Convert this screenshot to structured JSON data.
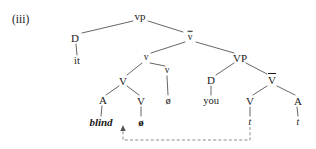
{
  "figure": {
    "example_number": "(iii)",
    "type": "syntax-tree"
  },
  "nodes": {
    "vp": {
      "label": "vp",
      "style": "cat",
      "x": 140,
      "y": 16
    },
    "d_left": {
      "label": "D",
      "style": "cat",
      "x": 75,
      "y": 38
    },
    "it": {
      "label": "it",
      "style": "word",
      "x": 77,
      "y": 61
    },
    "v_bar_low": {
      "label": "v",
      "style": "bar",
      "x": 190,
      "y": 37
    },
    "v_small": {
      "label": "v",
      "style": "cat-small",
      "x": 146,
      "y": 58
    },
    "V_mid": {
      "label": "V",
      "style": "cat",
      "x": 123,
      "y": 81
    },
    "A_left": {
      "label": "A",
      "style": "cat",
      "x": 103,
      "y": 100
    },
    "blind": {
      "label": "blind",
      "style": "word-bold-italic",
      "x": 101,
      "y": 122
    },
    "V_inner": {
      "label": "V",
      "style": "cat",
      "x": 141,
      "y": 101
    },
    "null_bold": {
      "label": "ø",
      "style": "null-sym-bold",
      "x": 141,
      "y": 122
    },
    "v_right_small": {
      "label": "v",
      "style": "cat-small",
      "x": 167,
      "y": 71
    },
    "null_plain": {
      "label": "ø",
      "style": "null-sym",
      "x": 168,
      "y": 101
    },
    "VP": {
      "label": "VP",
      "style": "cat",
      "x": 240,
      "y": 58
    },
    "d_right": {
      "label": "D",
      "style": "cat",
      "x": 211,
      "y": 80
    },
    "you": {
      "label": "you",
      "style": "word",
      "x": 211,
      "y": 101
    },
    "V_bar_right": {
      "label": "V",
      "style": "bar",
      "x": 272,
      "y": 80
    },
    "V_right": {
      "label": "V",
      "style": "cat",
      "x": 250,
      "y": 101
    },
    "trace_v": {
      "label": "t",
      "style": "trace",
      "x": 250,
      "y": 122
    },
    "A_right": {
      "label": "A",
      "style": "cat",
      "x": 298,
      "y": 101
    },
    "trace_a": {
      "label": "t",
      "style": "trace",
      "x": 298,
      "y": 122
    }
  },
  "movement_arrow": {
    "from_node": "trace_a",
    "to_node": "blind",
    "style": "dashed",
    "color": "#7a7a7a"
  },
  "colors": {
    "ink": "#1a1a1a",
    "branch": "#555555",
    "dashed": "#808080",
    "background": "#ffffff"
  }
}
